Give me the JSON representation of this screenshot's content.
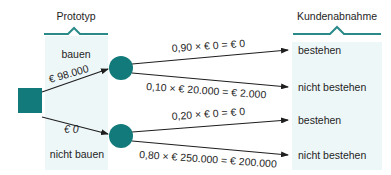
{
  "colors": {
    "node": "#127a7a",
    "panel": "#eef7f8",
    "bracket": "#2a8a88",
    "line": "#1e1e1e"
  },
  "columns": {
    "left_header": "Prototyp",
    "right_header": "Kundenabnahme"
  },
  "decision_node": {
    "shape": "square"
  },
  "decision_branches": [
    {
      "label": "bauen",
      "cost": "€ 98.000"
    },
    {
      "label": "nicht bauen",
      "cost": "€ 0"
    }
  ],
  "chance_branches": [
    {
      "formula": "0,90 × € 0 = € 0",
      "outcome": "bestehen"
    },
    {
      "formula": "0,10 × € 20.000 = € 2.000",
      "outcome": "nicht bestehen"
    },
    {
      "formula": "0,20 × € 0 = € 0",
      "outcome": "bestehen"
    },
    {
      "formula": "0,80 × € 250.000 = € 200.000",
      "outcome": "nicht bestehen"
    }
  ]
}
